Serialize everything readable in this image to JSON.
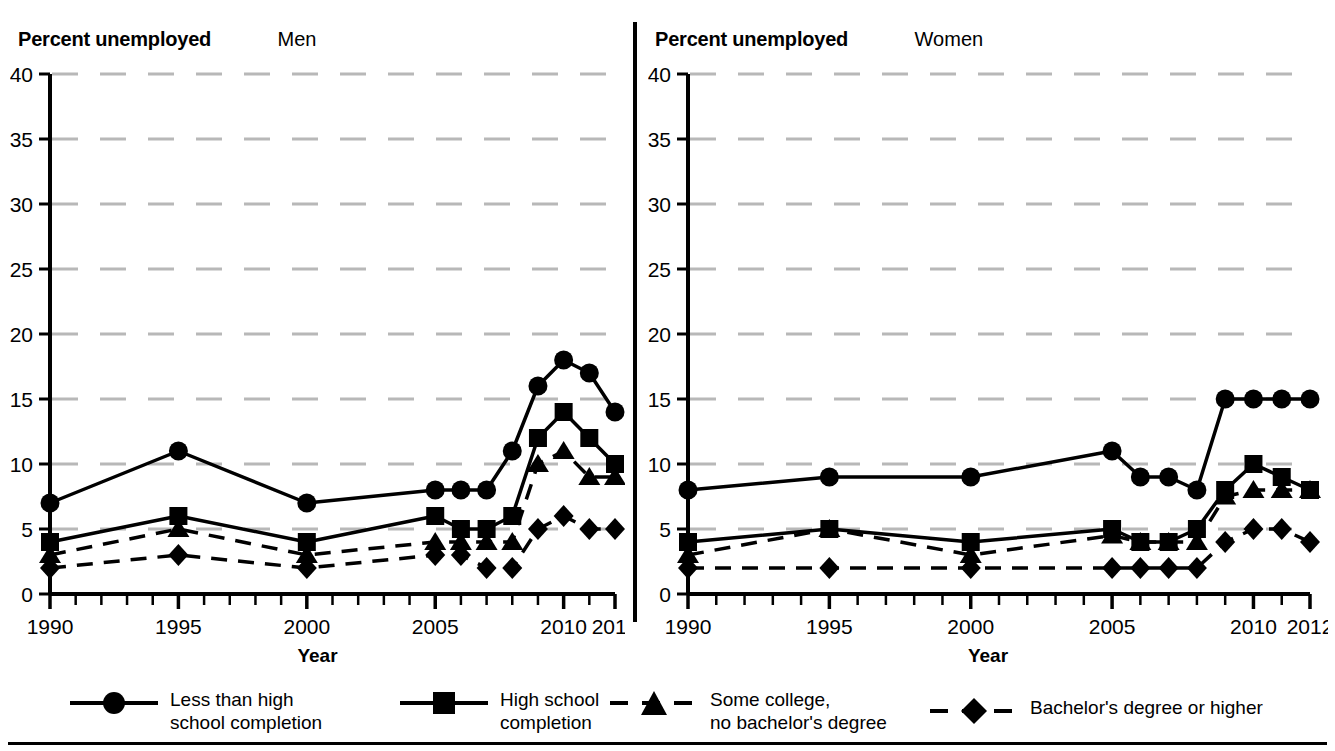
{
  "panels": [
    {
      "id": "men",
      "y_axis_title": "Percent unemployed",
      "name": "Men",
      "x_axis_label": "Year"
    },
    {
      "id": "women",
      "y_axis_title": "Percent unemployed",
      "name": "Women",
      "x_axis_label": "Year"
    }
  ],
  "legend": {
    "items": [
      {
        "marker": "circle-marker",
        "line": "solid",
        "label": "Less than high\nschool completion"
      },
      {
        "marker": "square-marker",
        "line": "solid",
        "label": "High school\ncompletion"
      },
      {
        "marker": "triangle-marker",
        "line": "dashed",
        "label": "Some college,\nno bachelor's degree"
      },
      {
        "marker": "diamond-marker",
        "line": "dashed",
        "label": "Bachelor's degree or higher"
      }
    ]
  },
  "colors": {
    "ink": "#000000",
    "gridline": "#b8b8b8",
    "background": "#ffffff"
  },
  "chart_data": [
    {
      "type": "line",
      "title": "Men",
      "subtitle": "Percent unemployed",
      "xlabel": "Year",
      "ylabel": "Percent unemployed",
      "xlim": [
        1990,
        2012
      ],
      "ylim": [
        0,
        40
      ],
      "ytick_labels": [
        "0",
        "5",
        "10",
        "15",
        "20",
        "25",
        "30",
        "35",
        "40"
      ],
      "yticks": [
        0,
        5,
        10,
        15,
        20,
        25,
        30,
        35,
        40
      ],
      "xtick_labels": [
        "1990",
        "1995",
        "2000",
        "2005",
        "2010",
        "2012"
      ],
      "xticks": [
        1990,
        1995,
        2000,
        2005,
        2010,
        2012
      ],
      "grid": "horizontal-dashed",
      "legend_position": "below",
      "x": [
        1990,
        1995,
        2000,
        2005,
        2006,
        2007,
        2008,
        2009,
        2010,
        2011,
        2012
      ],
      "series": [
        {
          "name": "Less than high school completion",
          "marker": "circle",
          "line": "solid",
          "values": [
            7,
            11,
            7,
            8,
            8,
            8,
            11,
            16,
            18,
            17,
            14
          ]
        },
        {
          "name": "High school completion",
          "marker": "square",
          "line": "solid",
          "values": [
            4,
            6,
            4,
            6,
            5,
            5,
            6,
            12,
            14,
            12,
            10
          ]
        },
        {
          "name": "Some college, no bachelor's degree",
          "marker": "triangle",
          "line": "dashed",
          "values": [
            3,
            5,
            3,
            4,
            4,
            4,
            4,
            10,
            11,
            9,
            9
          ]
        },
        {
          "name": "Bachelor's degree or higher",
          "marker": "diamond",
          "line": "dashed",
          "values": [
            2,
            3,
            2,
            3,
            3,
            2,
            2,
            5,
            6,
            5,
            5
          ]
        }
      ]
    },
    {
      "type": "line",
      "title": "Women",
      "subtitle": "Percent unemployed",
      "xlabel": "Year",
      "ylabel": "Percent unemployed",
      "xlim": [
        1990,
        2012
      ],
      "ylim": [
        0,
        40
      ],
      "ytick_labels": [
        "0",
        "5",
        "10",
        "15",
        "20",
        "25",
        "30",
        "35",
        "40"
      ],
      "yticks": [
        0,
        5,
        10,
        15,
        20,
        25,
        30,
        35,
        40
      ],
      "xtick_labels": [
        "1990",
        "1995",
        "2000",
        "2005",
        "2010",
        "2012"
      ],
      "xticks": [
        1990,
        1995,
        2000,
        2005,
        2010,
        2012
      ],
      "grid": "horizontal-dashed",
      "legend_position": "below",
      "x": [
        1990,
        1995,
        2000,
        2005,
        2006,
        2007,
        2008,
        2009,
        2010,
        2011,
        2012
      ],
      "series": [
        {
          "name": "Less than high school completion",
          "marker": "circle",
          "line": "solid",
          "values": [
            8,
            9,
            9,
            11,
            9,
            9,
            8,
            15,
            15,
            15,
            15
          ]
        },
        {
          "name": "High school completion",
          "marker": "square",
          "line": "solid",
          "values": [
            4,
            5,
            4,
            5,
            4,
            4,
            5,
            8,
            10,
            9,
            8
          ]
        },
        {
          "name": "Some college, no bachelor's degree",
          "marker": "triangle",
          "line": "dashed",
          "values": [
            3,
            5,
            3,
            4.5,
            4,
            4,
            4,
            7.5,
            8,
            8,
            8
          ]
        },
        {
          "name": "Bachelor's degree or higher",
          "marker": "diamond",
          "line": "dashed",
          "values": [
            2,
            2,
            2,
            2,
            2,
            2,
            2,
            4,
            5,
            5,
            4
          ]
        }
      ]
    }
  ]
}
